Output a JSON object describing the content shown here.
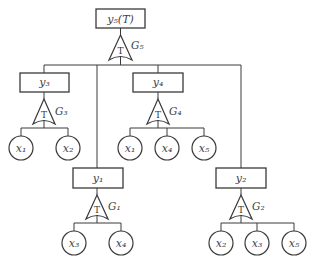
{
  "diagram": {
    "type": "fault-tree",
    "top_event": {
      "id": "y5",
      "label": "y₅(T)",
      "gate": "G5"
    },
    "gates": [
      {
        "id": "G5",
        "label": "G₅",
        "symbol": "T",
        "output": "y5",
        "inputs": [
          "y3",
          "y1",
          "y4",
          "y2"
        ]
      },
      {
        "id": "G3",
        "label": "G₃",
        "symbol": "T",
        "output": "y3",
        "inputs": [
          "x1",
          "x2"
        ]
      },
      {
        "id": "G4",
        "label": "G₄",
        "symbol": "T",
        "output": "y4",
        "inputs": [
          "x1",
          "x4",
          "x5"
        ]
      },
      {
        "id": "G1",
        "label": "G₁",
        "symbol": "T",
        "output": "y1",
        "inputs": [
          "x3",
          "x4"
        ]
      },
      {
        "id": "G2",
        "label": "G₂",
        "symbol": "T",
        "output": "y2",
        "inputs": [
          "x2",
          "x3",
          "x5"
        ]
      }
    ],
    "events": {
      "y5": "y₅(T)",
      "y3": "y₃",
      "y4": "y₄",
      "y1": "y₁",
      "y2": "y₂"
    },
    "basic_events": {
      "g3": [
        "x₁",
        "x₂"
      ],
      "g4": [
        "x₁",
        "x₄",
        "x₅"
      ],
      "g1": [
        "x₃",
        "x₄"
      ],
      "g2": [
        "x₂",
        "x₃",
        "x₅"
      ]
    },
    "gate_symbol": "T",
    "gate_labels": {
      "g5": "G₅",
      "g3": "G₃",
      "g4": "G₄",
      "g1": "G₁",
      "g2": "G₂"
    }
  }
}
